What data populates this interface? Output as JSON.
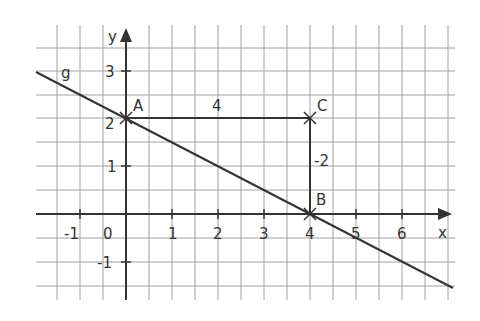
{
  "diagram": {
    "type": "coordinate-plane",
    "axes": {
      "x_label": "x",
      "y_label": "y",
      "origin_label": "0",
      "x_ticks": [
        "-1",
        "1",
        "2",
        "3",
        "4",
        "5",
        "6"
      ],
      "y_ticks": [
        "3",
        "2",
        "1",
        "-1"
      ]
    },
    "line": {
      "name": "g",
      "passes_through": [
        [
          0,
          2
        ],
        [
          4,
          0
        ]
      ]
    },
    "points": [
      {
        "name": "A",
        "x": 0,
        "y": 2
      },
      {
        "name": "B",
        "x": 4,
        "y": 0
      },
      {
        "name": "C",
        "x": 4,
        "y": 2
      }
    ],
    "segments": [
      {
        "from": "A",
        "to": "C",
        "label": "4"
      },
      {
        "from": "C",
        "to": "B",
        "label": "-2"
      }
    ],
    "colors": {
      "grid": "#9a9a9a",
      "ink": "#333333",
      "background": "#ffffff"
    }
  }
}
